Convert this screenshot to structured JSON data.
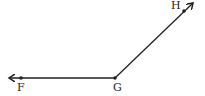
{
  "diagram": {
    "type": "angle",
    "vertex": {
      "label": "G",
      "x": 115,
      "y": 78
    },
    "rays": [
      {
        "name": "ray-GF",
        "label": "F",
        "point": {
          "x": 21,
          "y": 78
        },
        "arrow_tip": {
          "x": 9,
          "y": 78
        }
      },
      {
        "name": "ray-GH",
        "label": "H",
        "point": {
          "x": 184,
          "y": 11
        },
        "arrow_tip": {
          "x": 193,
          "y": 3
        }
      }
    ],
    "labels": {
      "F": "F",
      "G": "G",
      "H": "H"
    },
    "line_color": "#222222"
  }
}
